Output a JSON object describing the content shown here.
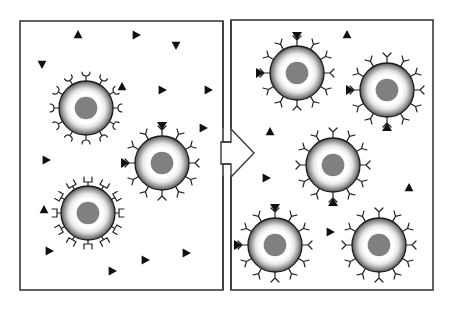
{
  "diagram": {
    "colors": {
      "frame": "#3a3a3a",
      "ligand": "#111111",
      "nucleus": "#808080",
      "membrane_outer": "#5a5a5a",
      "membrane_inner": "#ffffff",
      "receptor": "#222222"
    },
    "panels": [
      {
        "id": "before",
        "label": "",
        "x": 20,
        "y": 21,
        "w": 203,
        "h": 269
      },
      {
        "id": "after",
        "label": "",
        "x": 231,
        "y": 20,
        "w": 202,
        "h": 270
      }
    ],
    "arrow": {
      "direction": "right",
      "from": "before",
      "to": "after"
    },
    "before": {
      "cells": [
        {
          "id": "cell-cup",
          "cx": 86,
          "cy": 108,
          "r": 27,
          "receptor_type": "cup",
          "bound": []
        },
        {
          "id": "cell-y",
          "cx": 162,
          "cy": 163,
          "r": 27,
          "receptor_type": "y",
          "bound": [
            0,
            270,
            45
          ]
        },
        {
          "id": "cell-square",
          "cx": 88,
          "cy": 213,
          "r": 27,
          "receptor_type": "square",
          "bound": []
        }
      ],
      "free_ligands": [
        {
          "x": 78,
          "y": 35,
          "rot": 0
        },
        {
          "x": 136,
          "y": 35,
          "rot": 90
        },
        {
          "x": 176,
          "y": 45,
          "rot": 180
        },
        {
          "x": 42,
          "y": 64,
          "rot": 180
        },
        {
          "x": 122,
          "y": 87,
          "rot": 0
        },
        {
          "x": 162,
          "y": 90,
          "rot": 90
        },
        {
          "x": 208,
          "y": 90,
          "rot": 90
        },
        {
          "x": 203,
          "y": 128,
          "rot": 90
        },
        {
          "x": 46,
          "y": 160,
          "rot": 90
        },
        {
          "x": 44,
          "y": 210,
          "rot": 0
        },
        {
          "x": 49,
          "y": 251,
          "rot": 90
        },
        {
          "x": 145,
          "y": 260,
          "rot": 90
        },
        {
          "x": 186,
          "y": 253,
          "rot": 90
        },
        {
          "x": 112,
          "y": 271,
          "rot": 90
        }
      ]
    },
    "after": {
      "cells": [
        {
          "id": "cell-r1",
          "cx": 297,
          "cy": 73,
          "r": 27,
          "receptor_type": "y",
          "bound": [
            0,
            270
          ]
        },
        {
          "id": "cell-r2",
          "cx": 387,
          "cy": 90,
          "r": 27,
          "receptor_type": "y",
          "bound": [
            45,
            270,
            180
          ]
        },
        {
          "id": "cell-r3",
          "cx": 333,
          "cy": 165,
          "r": 27,
          "receptor_type": "y",
          "bound": [
            315,
            180
          ]
        },
        {
          "id": "cell-r4",
          "cx": 275,
          "cy": 245,
          "r": 27,
          "receptor_type": "y",
          "bound": [
            0,
            315,
            270
          ]
        },
        {
          "id": "cell-r5",
          "cx": 379,
          "cy": 245,
          "r": 27,
          "receptor_type": "y",
          "bound": [
            45,
            225,
            135
          ]
        }
      ],
      "free_ligands": [
        {
          "x": 347,
          "y": 35,
          "rot": 0
        },
        {
          "x": 270,
          "y": 132,
          "rot": 0
        },
        {
          "x": 266,
          "y": 178,
          "rot": 90
        },
        {
          "x": 409,
          "y": 188,
          "rot": 0
        },
        {
          "x": 330,
          "y": 232,
          "rot": 90
        }
      ]
    }
  }
}
